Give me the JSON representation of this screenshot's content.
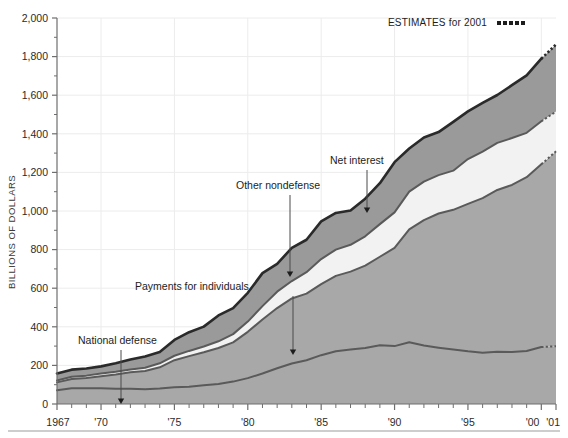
{
  "figure": {
    "background": "#ffffff",
    "bottom_rule_color": "#9b9b9b"
  },
  "axis": {
    "y_title": "BILLIONS OF DOLLARS",
    "y_ticks": [
      "2,000",
      "1,800",
      "1,600",
      "1,400",
      "1,200",
      "1,000",
      "800",
      "600",
      "400",
      "200",
      "0"
    ],
    "x_ticks": [
      "1967",
      "'70",
      "'75",
      "'80",
      "'85",
      "'90",
      "'95",
      "'00",
      "'01"
    ],
    "x_tick_years": [
      1967,
      1970,
      1975,
      1980,
      1985,
      1990,
      1995,
      2000,
      2001
    ]
  },
  "legend": {
    "estimates_label": "ESTIMATES for 2001",
    "estimates_marker": "dotted-line-swatch"
  },
  "annotations": [
    {
      "label": "National defense",
      "text_x": 78,
      "text_y": 344,
      "arrow_x": 121,
      "arrow_y0": 350,
      "arrow_y1": 404,
      "anchor": "start"
    },
    {
      "label": "Payments for individuals",
      "text_x": 135,
      "text_y": 290,
      "arrow_x": 293,
      "arrow_y0": 296,
      "arrow_y1": 355,
      "anchor": "start"
    },
    {
      "label": "Other nondefense",
      "text_x": 236,
      "text_y": 189,
      "arrow_x": 290,
      "arrow_y0": 195,
      "arrow_y1": 277,
      "anchor": "start"
    },
    {
      "label": "Net interest",
      "text_x": 330,
      "text_y": 164,
      "arrow_x": 367,
      "arrow_y0": 170,
      "arrow_y1": 213,
      "anchor": "start"
    }
  ],
  "colors": {
    "national_defense": "#a8a8a8",
    "payments_for_individuals": "#a8a8a8",
    "net_interest": "#f2f2f2",
    "other_nondefense": "#9a9a9a",
    "boundary_line": "#5a5a5a",
    "top_outline": "#2a2a2a",
    "gridline": "#ececec",
    "axis": "#6e6e6e"
  },
  "chart_data": {
    "type": "area",
    "title": "",
    "subtitle": "",
    "xlabel": "",
    "ylabel": "BILLIONS OF DOLLARS",
    "xlim": [
      1967,
      2001
    ],
    "ylim": [
      0,
      2000
    ],
    "grid": true,
    "stacked": true,
    "legend_position": "annotations-inline",
    "estimate_note": "ESTIMATES for 2001",
    "estimate_years": [
      2001
    ],
    "x": [
      1967,
      1968,
      1969,
      1970,
      1971,
      1972,
      1973,
      1974,
      1975,
      1976,
      1977,
      1978,
      1979,
      1980,
      1981,
      1982,
      1983,
      1984,
      1985,
      1986,
      1987,
      1988,
      1989,
      1990,
      1991,
      1992,
      1993,
      1994,
      1995,
      1996,
      1997,
      1998,
      1999,
      2000,
      2001
    ],
    "series": [
      {
        "name": "National defense",
        "stack_order": 1,
        "values": [
          71,
          82,
          82,
          82,
          79,
          79,
          77,
          80,
          87,
          90,
          97,
          104,
          116,
          134,
          158,
          185,
          210,
          227,
          253,
          273,
          282,
          290,
          304,
          300,
          320,
          303,
          292,
          282,
          273,
          266,
          271,
          269,
          275,
          295,
          299
        ]
      },
      {
        "name": "Payments for individuals",
        "stack_order": 2,
        "values": [
          41,
          48,
          53,
          62,
          74,
          85,
          94,
          110,
          140,
          158,
          171,
          186,
          203,
          240,
          280,
          312,
          337,
          345,
          368,
          391,
          404,
          427,
          459,
          509,
          585,
          650,
          695,
          724,
          764,
          801,
          838,
          866,
          900,
          947,
          1010
        ]
      },
      {
        "name": "Net interest",
        "stack_order": 3,
        "values": [
          10,
          11,
          12,
          14,
          14,
          15,
          17,
          21,
          23,
          27,
          30,
          35,
          43,
          53,
          69,
          85,
          90,
          111,
          130,
          136,
          139,
          152,
          169,
          184,
          195,
          199,
          199,
          203,
          232,
          241,
          244,
          243,
          230,
          223,
          206
        ]
      },
      {
        "name": "Other nondefense",
        "stack_order": 4,
        "values": [
          36,
          37,
          37,
          37,
          44,
          52,
          58,
          58,
          82,
          97,
          103,
          134,
          135,
          149,
          171,
          144,
          172,
          168,
          195,
          190,
          178,
          195,
          212,
          260,
          224,
          229,
          223,
          253,
          247,
          252,
          248,
          274,
          298,
          324,
          348
        ]
      }
    ],
    "totals": [
      158,
      178,
      184,
      195,
      211,
      231,
      246,
      269,
      332,
      372,
      401,
      459,
      497,
      576,
      678,
      726,
      809,
      851,
      946,
      990,
      1003,
      1064,
      1144,
      1253,
      1324,
      1381,
      1409,
      1462,
      1516,
      1560,
      1601,
      1652,
      1703,
      1789,
      1863
    ]
  }
}
